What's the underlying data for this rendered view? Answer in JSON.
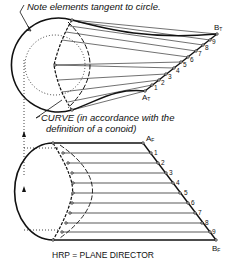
{
  "annotations": {
    "note_top": "Note elements tangent to circle.",
    "curve_line1": "CURVE (in accordance with the",
    "curve_line2": "definition of a conoid)",
    "bottom_caption": "HRP = PLANE DIRECTOR"
  },
  "labels": {
    "top_a": "A",
    "top_a_sub": "T",
    "top_b": "B",
    "top_b_sub": "T",
    "front_a": "A",
    "front_a_sub": "F",
    "front_b": "B",
    "front_b_sub": "F",
    "numbers": [
      "1",
      "2",
      "3",
      "4",
      "5",
      "6",
      "7",
      "8",
      "9"
    ]
  }
}
